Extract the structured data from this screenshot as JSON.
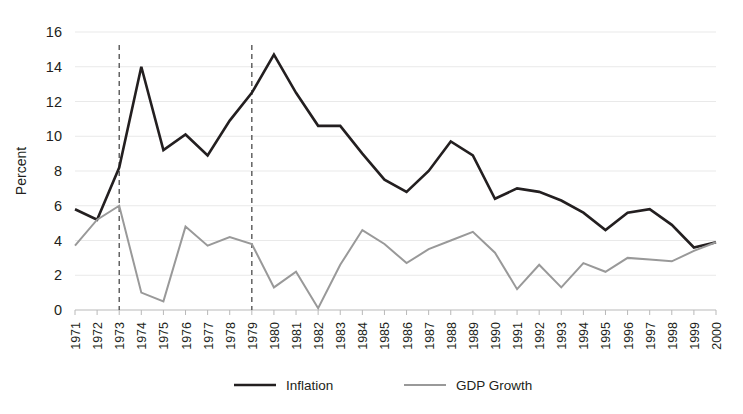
{
  "chart_data": {
    "type": "line",
    "title": "",
    "subtitle": "",
    "xlabel": "",
    "ylabel": "Percent",
    "ylim": [
      0,
      16
    ],
    "yticks": [
      0,
      2,
      4,
      6,
      8,
      10,
      12,
      14,
      16
    ],
    "grid": "horizontal",
    "legend_position": "bottom",
    "x": [
      1971,
      1972,
      1973,
      1974,
      1975,
      1976,
      1977,
      1978,
      1979,
      1980,
      1981,
      1982,
      1983,
      1984,
      1985,
      1986,
      1987,
      1988,
      1989,
      1990,
      1991,
      1992,
      1993,
      1994,
      1995,
      1996,
      1997,
      1998,
      1999,
      2000
    ],
    "categories": [
      "1971",
      "1972",
      "1973",
      "1974",
      "1975",
      "1976",
      "1977",
      "1978",
      "1979",
      "1980",
      "1981",
      "1982",
      "1983",
      "1984",
      "1985",
      "1986",
      "1987",
      "1988",
      "1989",
      "1990",
      "1991",
      "1992",
      "1993",
      "1994",
      "1995",
      "1996",
      "1997",
      "1998",
      "1999",
      "2000"
    ],
    "series": [
      {
        "name": "Inflation",
        "color": "#231f20",
        "width": 2.6,
        "values": [
          5.8,
          5.2,
          8.2,
          14.0,
          9.2,
          10.1,
          8.9,
          10.9,
          12.5,
          14.7,
          12.5,
          10.6,
          10.6,
          9.0,
          7.5,
          6.8,
          8.0,
          9.7,
          8.9,
          6.4,
          7.0,
          6.8,
          6.3,
          5.6,
          4.6,
          5.6,
          5.8,
          4.9,
          3.6,
          3.9
        ]
      },
      {
        "name": "GDP Growth",
        "color": "#999999",
        "width": 2.0,
        "values": [
          3.7,
          5.2,
          6.0,
          1.0,
          0.5,
          4.8,
          3.7,
          4.2,
          3.8,
          1.3,
          2.2,
          0.1,
          2.6,
          4.6,
          3.8,
          2.7,
          3.5,
          4.0,
          4.5,
          3.3,
          1.2,
          2.6,
          1.3,
          2.7,
          2.2,
          3.0,
          2.9,
          2.8,
          3.4,
          3.9
        ]
      }
    ],
    "annotations": [
      {
        "name": "oil-shock-1973",
        "type": "vertical-dashed-line",
        "x": 1973,
        "label": ""
      },
      {
        "name": "oil-shock-1979",
        "type": "vertical-dashed-line",
        "x": 1979,
        "label": ""
      }
    ]
  },
  "legend": {
    "items": [
      {
        "label": "Inflation",
        "color": "#231f20",
        "width": 2.6
      },
      {
        "label": "GDP Growth",
        "color": "#999999",
        "width": 2.0
      }
    ]
  }
}
